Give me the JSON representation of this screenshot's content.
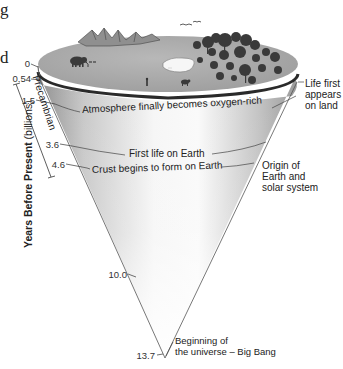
{
  "figure": {
    "type": "cone-timeline",
    "cut_off_text": {
      "top_fragment": "g",
      "middle_fragment": "d"
    },
    "axis": {
      "title_bold": "Years Before Present",
      "title_unit": "(billions)",
      "era_bracket_label": "Precambrian"
    },
    "ticks": [
      {
        "value": "0"
      },
      {
        "value": "0.54"
      },
      {
        "value": "1.5"
      },
      {
        "value": "3.6"
      },
      {
        "value": "4.6"
      },
      {
        "value": "10.0"
      },
      {
        "value": "13.7"
      }
    ],
    "events_inside": [
      {
        "at": "1.5",
        "text": "Atmosphere finally becomes oxygen-rich"
      },
      {
        "at": "3.6",
        "text": "First life on Earth"
      },
      {
        "at": "4.6",
        "text": "Crust begins to form on Earth"
      }
    ],
    "callouts_right": [
      {
        "at": "0.54",
        "lines": [
          "Life first",
          "appears",
          "on land"
        ]
      },
      {
        "at": "4.6",
        "lines": [
          "Origin of",
          "Earth and",
          "solar system"
        ]
      },
      {
        "at": "13.7",
        "lines": [
          "Beginning of",
          "the universe – Big Bang"
        ]
      }
    ],
    "scene_icons": [
      "mountains-icon",
      "mammoth-icon",
      "human-icon",
      "lake-icon",
      "cattle-icon",
      "forest-icon",
      "birds-icon"
    ],
    "colors": {
      "cone_shade": "#9a9a9a",
      "cone_light": "#f4f4f4",
      "surface": "#a8a8a8",
      "rim": "#2a2a2a",
      "trees": "#3a3a3a",
      "text": "#222222"
    }
  }
}
